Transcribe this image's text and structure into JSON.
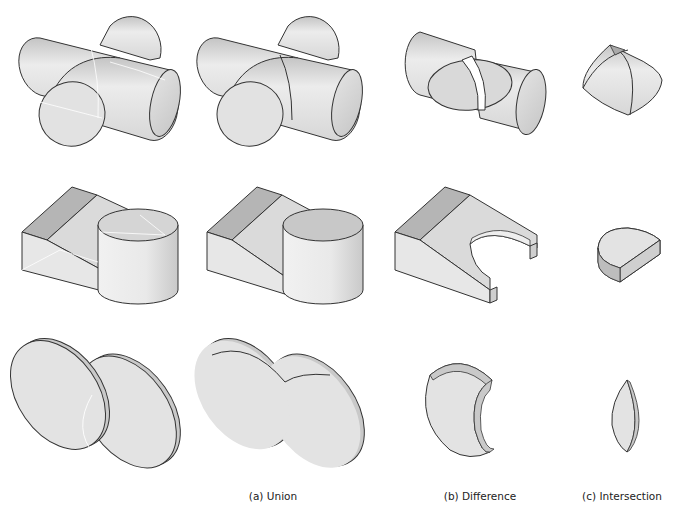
{
  "figure": {
    "columns": [
      {
        "id": "operands",
        "caption": ""
      },
      {
        "id": "union",
        "caption": "(a) Union"
      },
      {
        "id": "difference",
        "caption": "(b) Difference"
      },
      {
        "id": "intersection",
        "caption": "(c) Intersection"
      }
    ],
    "rows": [
      {
        "id": "cylinders",
        "operands": "two crossing cylinders"
      },
      {
        "id": "wedge-cylinder",
        "operands": "wedge block and cylinder"
      },
      {
        "id": "discs",
        "operands": "two overlapping discs"
      }
    ],
    "colors": {
      "face_light": "#e6e6e6",
      "face_mid": "#cfcfcf",
      "face_dark": "#a9a9a9",
      "edge": "#333333",
      "hidden_edge": "#ffffff",
      "background": "#ffffff"
    }
  }
}
